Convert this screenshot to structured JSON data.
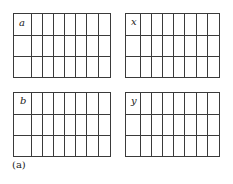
{
  "figure": {
    "caption": "(a)",
    "grids": [
      {
        "id": "a",
        "label": "a",
        "left": 13,
        "top": 13,
        "width": 97,
        "height": 64
      },
      {
        "id": "x",
        "label": "x",
        "left": 125,
        "top": 13,
        "width": 94,
        "height": 64
      },
      {
        "id": "b",
        "label": "b",
        "left": 13,
        "top": 92,
        "width": 97,
        "height": 64
      },
      {
        "id": "y",
        "label": "y",
        "left": 125,
        "top": 92,
        "width": 94,
        "height": 64
      }
    ],
    "columns": 8,
    "rows": 3,
    "line_color": "#3a3a3a"
  }
}
